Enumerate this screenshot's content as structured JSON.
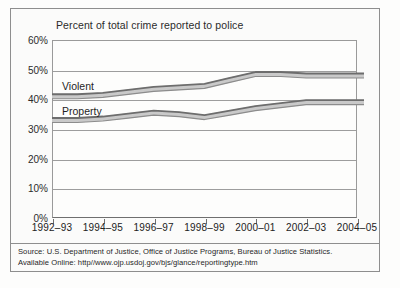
{
  "figure": {
    "title": "Percent of total crime reported to police",
    "source_line1": "Source: U.S. Department of Justice, Office of Justice Programs, Bureau of Justice Statistics.",
    "source_line2": "Available Online: http//www.ojp.usdoj.gov/bjs/glance/reportingtype.htm"
  },
  "colors": {
    "line_dark": "#6d6d6d",
    "line_light": "#c9c9c9",
    "grid": "#9d9d9d",
    "axis": "#6f6f6f",
    "text": "#222222",
    "frame": "#8e8e8e",
    "background": "#fbfbfa"
  },
  "chart_data": {
    "type": "line",
    "title": "Percent of total crime reported to police",
    "xlabel": "",
    "ylabel": "",
    "ylim": [
      0,
      60
    ],
    "ytick_labels": [
      "0%",
      "10%",
      "20%",
      "30%",
      "40%",
      "50%",
      "60%"
    ],
    "ytick_values": [
      0,
      10,
      20,
      30,
      40,
      50,
      60
    ],
    "grid": true,
    "legend": "inline-labels",
    "categories": [
      "1992-93",
      "1993-94",
      "1994-95",
      "1995-96",
      "1996-97",
      "1997-98",
      "1998-99",
      "1999-00",
      "2000-01",
      "2001-02",
      "2002-03",
      "2003-04",
      "2004-05"
    ],
    "xtick_labels": [
      "1992–93",
      "1994–95",
      "1996–97",
      "1998–99",
      "2000–01",
      "2002–03",
      "2004–05"
    ],
    "xtick_values": [
      "1992-93",
      "1994-95",
      "1996-97",
      "1998-99",
      "2000-01",
      "2002-03",
      "2004-05"
    ],
    "series": [
      {
        "name": "Violent",
        "label": "Violent",
        "values": [
          41,
          41,
          41.5,
          42.5,
          43.5,
          44,
          44.5,
          46.5,
          48.5,
          48.5,
          48,
          48,
          48
        ]
      },
      {
        "name": "Property",
        "label": "Property",
        "values": [
          33,
          33,
          33.5,
          34.5,
          35.5,
          35,
          34,
          35.5,
          37,
          38,
          39,
          39,
          39
        ]
      }
    ]
  }
}
